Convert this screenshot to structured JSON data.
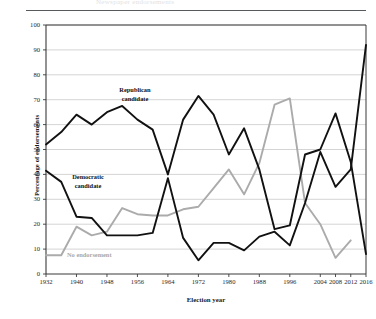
{
  "figure": {
    "ghost_caption": "Newspaper endorsements",
    "ylabel": "Percentage of endorsements",
    "xlabel": "Election year"
  },
  "annotations": {
    "republican": "Republican\ncandidate",
    "republican_line1": "Republican",
    "republican_line2": "candidate",
    "democratic_line1": "Democratic",
    "democratic_line2": "candidate",
    "no_endorsement": "No endorsement"
  },
  "colors": {
    "series_dark": "#111111",
    "series_gray": "#ababab",
    "grid": "#c9c9c9",
    "axis": "#3a3a3a",
    "rule": "#555a5e"
  },
  "chart_data": {
    "type": "line",
    "title": "",
    "xlabel": "Election year",
    "ylabel": "Percentage of endorsements",
    "xlim": [
      1932,
      2016
    ],
    "ylim": [
      0,
      100
    ],
    "ytick_labels": [
      "0",
      "10",
      "20",
      "30",
      "40",
      "50",
      "60",
      "70",
      "80",
      "90",
      "100"
    ],
    "ytick_values": [
      0,
      10,
      20,
      30,
      40,
      50,
      60,
      70,
      80,
      90,
      100
    ],
    "xtick_labels": [
      "1932",
      "1940",
      "1948",
      "1956",
      "1964",
      "1972",
      "1980",
      "1988",
      "1996",
      "2004",
      "2008",
      "2012",
      "2016"
    ],
    "xtick_values": [
      1932,
      1940,
      1948,
      1956,
      1964,
      1972,
      1980,
      1988,
      1996,
      2004,
      2008,
      2012,
      2016
    ],
    "grid": "horizontal",
    "legend": "inline-annotations",
    "x": [
      1932,
      1936,
      1940,
      1944,
      1948,
      1952,
      1956,
      1960,
      1964,
      1968,
      1972,
      1976,
      1980,
      1984,
      1988,
      1992,
      1996,
      2000,
      2004,
      2008,
      2012,
      2016
    ],
    "series": [
      {
        "name": "Republican candidate",
        "color": "#111111",
        "values": [
          52,
          57,
          64,
          60,
          65,
          67.5,
          62,
          58,
          40,
          62,
          71.5,
          64,
          48,
          58.5,
          42,
          18,
          19.5,
          48,
          50,
          64.5,
          45,
          8
        ]
      },
      {
        "name": "Democratic candidate",
        "color": "#111111",
        "values": [
          41.5,
          37,
          23,
          22.5,
          15.5,
          15.5,
          15.5,
          16.5,
          38.5,
          14.5,
          5.5,
          12.5,
          12.5,
          9.5,
          15,
          17,
          11.5,
          28.5,
          49,
          35,
          42,
          92
        ]
      },
      {
        "name": "No endorsement",
        "color": "#ababab",
        "values": [
          7.5,
          7.5,
          19,
          15.5,
          17,
          26.5,
          24,
          23.5,
          23.5,
          26,
          27,
          34.5,
          42,
          32,
          44.5,
          68,
          70.5,
          28.5,
          20,
          6.5,
          13.5,
          null
        ]
      }
    ]
  }
}
